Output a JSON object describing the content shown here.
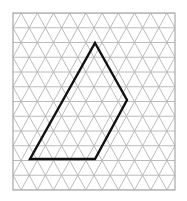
{
  "diagram": {
    "type": "isometric-triangle-grid",
    "grid": {
      "left": 13,
      "top": 13,
      "right": 175,
      "bottom": 190,
      "row_height": 14.75,
      "cell_width": 16.2,
      "line_color": "#b4b4b4",
      "border_color": "#a8a8a8"
    },
    "polygon": {
      "label": "quadrilateral",
      "stroke_color": "#111111",
      "vertices": [
        {
          "x": 95,
          "y": 43
        },
        {
          "x": 127,
          "y": 100
        },
        {
          "x": 95,
          "y": 159
        },
        {
          "x": 30,
          "y": 159
        }
      ]
    }
  }
}
